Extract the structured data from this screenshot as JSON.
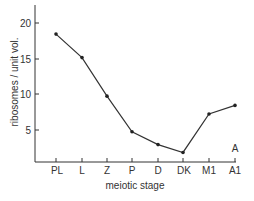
{
  "chart_data": {
    "type": "line",
    "title": "",
    "xlabel": "meiotic stage",
    "ylabel": "ribosomes / unit vol.",
    "categories": [
      "PL",
      "L",
      "Z",
      "P",
      "D",
      "DK",
      "M1",
      "A1"
    ],
    "series": [
      {
        "name": "ribosomes",
        "values": [
          18.5,
          15.2,
          9.8,
          4.8,
          3.0,
          1.9,
          7.3,
          8.5
        ]
      }
    ],
    "ylim": [
      0,
      22
    ],
    "yticks": [
      5,
      10,
      15,
      20
    ],
    "grid": false,
    "legend": null,
    "annotations": [
      {
        "text": "A",
        "x": "A1",
        "position": "above axis"
      }
    ]
  },
  "labels": {
    "xlabel": "meiotic stage",
    "ylabel": "ribosomes / unit vol.",
    "panel": "A",
    "yticks": [
      "5",
      "10",
      "15",
      "20"
    ],
    "xticks": [
      "PL",
      "L",
      "Z",
      "P",
      "D",
      "DK",
      "M1",
      "A1"
    ]
  },
  "colors": {
    "line": "#333333",
    "marker": "#222222",
    "axis": "#333333",
    "text": "#333333"
  }
}
